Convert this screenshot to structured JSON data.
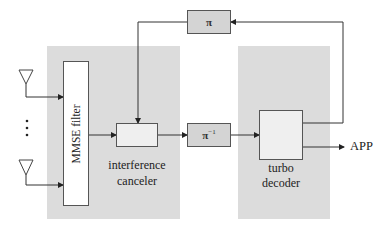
{
  "diagram": {
    "title": "",
    "blocks": {
      "mmse_filter": {
        "label": "MMSE filter"
      },
      "interference_canceler": {
        "label_line1": "interference",
        "label_line2": "canceler"
      },
      "interleaver": {
        "label": "π"
      },
      "deinterleaver": {
        "label": "π",
        "superscript": "−1"
      },
      "turbo_decoder": {
        "label_line1": "turbo",
        "label_line2": "decoder"
      }
    },
    "antennas": {
      "count_shown": 2,
      "ellipsis": "⋮"
    },
    "output": {
      "label": "APP"
    },
    "colors": {
      "panel": "#dcdcdc",
      "block_border": "#555555",
      "wire": "#333333",
      "pi_block_fill": "#d4d4d4"
    }
  }
}
